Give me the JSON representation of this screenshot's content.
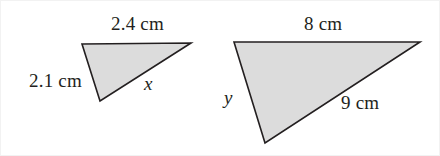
{
  "figure": {
    "background_color": "#ffffff",
    "stroke_color": "#231f20",
    "fill_color": "#dcdcdc",
    "text_color": "#231f20"
  },
  "shapes": [
    {
      "name": "small-triangle",
      "points": "82,44 191,43 100,101",
      "labels": {
        "top": "2.4 cm",
        "left": "2.1 cm",
        "hypotenuse": "x"
      }
    },
    {
      "name": "large-triangle",
      "points": "234,42 420,42 265,143",
      "labels": {
        "top": "8 cm",
        "left": "y",
        "hypotenuse": "9 cm"
      }
    }
  ],
  "labels": {
    "small_top": "2.4 cm",
    "small_left": "2.1 cm",
    "small_hyp": "x",
    "large_top": "8 cm",
    "large_left": "y",
    "large_hyp": "9 cm"
  }
}
